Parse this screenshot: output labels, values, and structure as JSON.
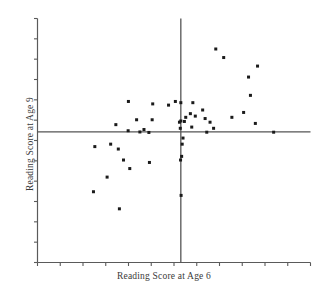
{
  "chart_data": {
    "type": "scatter",
    "title": "",
    "xlabel": "Reading Score at Age 6",
    "ylabel": "Reading Score at Age 9",
    "grid": false,
    "legend": null,
    "axis_ranges": {
      "xlim": [
        0,
        100
      ],
      "ylim": [
        0,
        100
      ]
    },
    "reference_lines": {
      "vertical_x": 52.5,
      "horizontal_y": 53.5,
      "color": "#555555",
      "note": "mean crosshair dividing plot into four quadrants"
    },
    "axis_style": {
      "line_color": "#5a5a5a",
      "tick_count_x": 13,
      "tick_count_y": 13,
      "tick_labels_x": [],
      "tick_labels_y": []
    },
    "marker": {
      "shape": "square",
      "color": "#1a1a1a",
      "size_px": 3
    },
    "points": [
      {
        "x": 50.5,
        "y": 66.0
      },
      {
        "x": 65.3,
        "y": 87.5
      },
      {
        "x": 68.2,
        "y": 84.0
      },
      {
        "x": 80.6,
        "y": 80.5
      },
      {
        "x": 77.3,
        "y": 76.0
      },
      {
        "x": 33.3,
        "y": 66.0
      },
      {
        "x": 42.2,
        "y": 65.0
      },
      {
        "x": 52.5,
        "y": 65.5
      },
      {
        "x": 48.0,
        "y": 64.5
      },
      {
        "x": 56.9,
        "y": 65.5
      },
      {
        "x": 60.5,
        "y": 62.5
      },
      {
        "x": 78.0,
        "y": 68.5
      },
      {
        "x": 75.5,
        "y": 61.5
      },
      {
        "x": 56.0,
        "y": 61.0
      },
      {
        "x": 57.8,
        "y": 60.0
      },
      {
        "x": 54.3,
        "y": 59.5
      },
      {
        "x": 61.4,
        "y": 59.0
      },
      {
        "x": 71.2,
        "y": 59.5
      },
      {
        "x": 52.5,
        "y": 58.0
      },
      {
        "x": 52.0,
        "y": 57.5
      },
      {
        "x": 53.8,
        "y": 57.8
      },
      {
        "x": 36.3,
        "y": 58.5
      },
      {
        "x": 42.0,
        "y": 58.5
      },
      {
        "x": 28.7,
        "y": 56.5
      },
      {
        "x": 63.2,
        "y": 57.5
      },
      {
        "x": 79.8,
        "y": 57.0
      },
      {
        "x": 64.5,
        "y": 55.0
      },
      {
        "x": 56.5,
        "y": 55.5
      },
      {
        "x": 52.3,
        "y": 55.0
      },
      {
        "x": 39.0,
        "y": 54.5
      },
      {
        "x": 33.2,
        "y": 54.0
      },
      {
        "x": 37.5,
        "y": 53.5
      },
      {
        "x": 40.8,
        "y": 53.3
      },
      {
        "x": 62.0,
        "y": 53.4
      },
      {
        "x": 86.5,
        "y": 53.4
      },
      {
        "x": 53.3,
        "y": 51.0
      },
      {
        "x": 53.0,
        "y": 48.5
      },
      {
        "x": 21.0,
        "y": 47.5
      },
      {
        "x": 26.8,
        "y": 48.5
      },
      {
        "x": 29.6,
        "y": 46.5
      },
      {
        "x": 52.8,
        "y": 43.5
      },
      {
        "x": 52.4,
        "y": 42.0
      },
      {
        "x": 31.5,
        "y": 42.0
      },
      {
        "x": 41.0,
        "y": 41.0
      },
      {
        "x": 33.8,
        "y": 38.5
      },
      {
        "x": 25.5,
        "y": 35.0
      },
      {
        "x": 52.6,
        "y": 27.5
      },
      {
        "x": 20.5,
        "y": 29.0
      },
      {
        "x": 30.0,
        "y": 22.0
      }
    ]
  }
}
